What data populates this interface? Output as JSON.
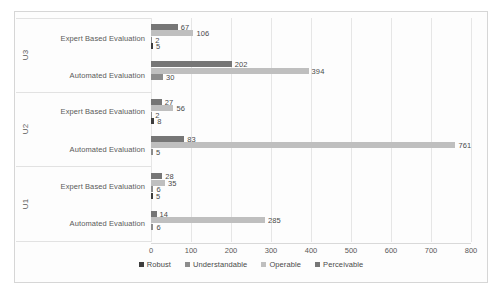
{
  "chart_data": {
    "type": "bar",
    "orientation": "horizontal",
    "title": "",
    "xlabel": "",
    "ylabel": "",
    "xlim": [
      0,
      800
    ],
    "xticks": [
      0,
      100,
      200,
      300,
      400,
      500,
      600,
      700,
      800
    ],
    "grid": true,
    "legend_position": "bottom-center",
    "legend": [
      "Robust",
      "Understandable",
      "Operable",
      "Perceivable"
    ],
    "series": [
      {
        "name": "Robust",
        "color": "#3d3d3d"
      },
      {
        "name": "Understandable",
        "color": "#8c8c8c"
      },
      {
        "name": "Operable",
        "color": "#bfbfbf"
      },
      {
        "name": "Perceivable",
        "color": "#767676"
      }
    ],
    "groups": [
      {
        "label": "U3",
        "categories": [
          {
            "label": "Expert Based Evaluation",
            "values": {
              "Robust": 5,
              "Understandable": 2,
              "Operable": 106,
              "Perceivable": 67
            }
          },
          {
            "label": "Automated Evaluation",
            "values": {
              "Robust": 0,
              "Understandable": 30,
              "Operable": 394,
              "Perceivable": 202
            }
          }
        ]
      },
      {
        "label": "U2",
        "categories": [
          {
            "label": "Expert Based Evaluation",
            "values": {
              "Robust": 8,
              "Understandable": 2,
              "Operable": 56,
              "Perceivable": 27
            }
          },
          {
            "label": "Automated Evaluation",
            "values": {
              "Robust": 0,
              "Understandable": 5,
              "Operable": 761,
              "Perceivable": 83
            }
          }
        ]
      },
      {
        "label": "U1",
        "categories": [
          {
            "label": "Expert Based Evaluation",
            "values": {
              "Robust": 5,
              "Understandable": 6,
              "Operable": 35,
              "Perceivable": 28
            }
          },
          {
            "label": "Automated Evaluation",
            "values": {
              "Robust": 0,
              "Understandable": 6,
              "Operable": 285,
              "Perceivable": 14
            }
          }
        ]
      }
    ]
  }
}
